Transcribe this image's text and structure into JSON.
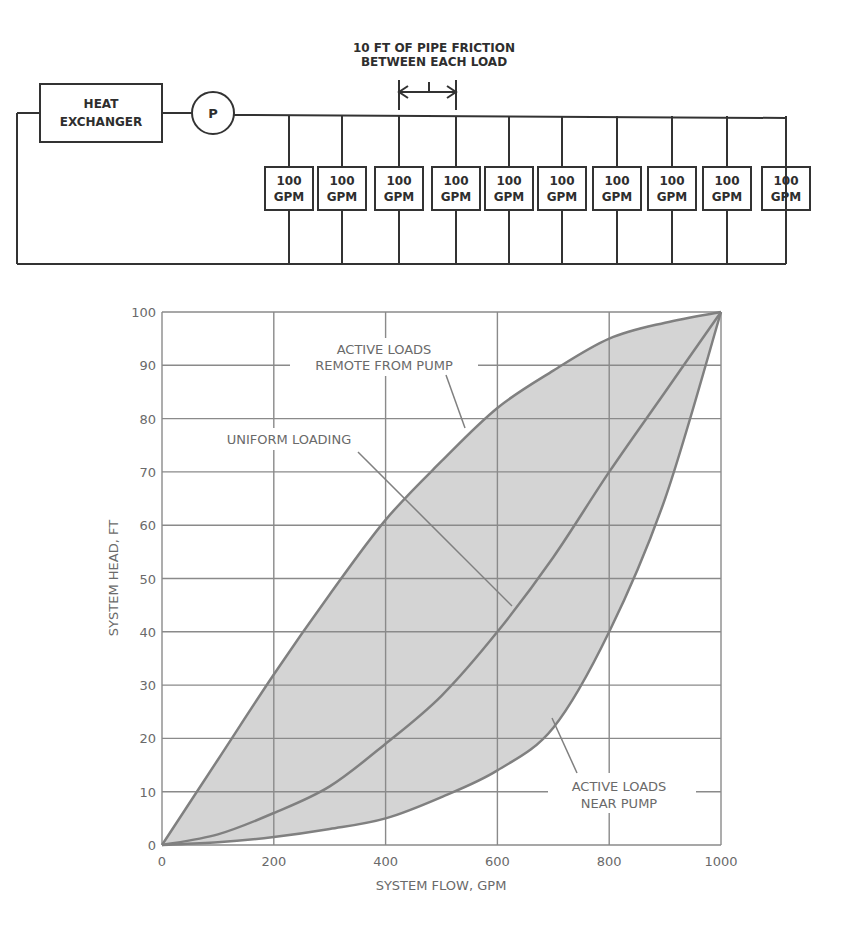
{
  "schematic": {
    "heat_exchanger_line1": "HEAT",
    "heat_exchanger_line2": "EXCHANGER",
    "pump_label": "P",
    "friction_note_line1": "10 FT OF PIPE FRICTION",
    "friction_note_line2": "BETWEEN EACH LOAD",
    "loads": [
      {
        "line1": "100",
        "line2": "GPM"
      },
      {
        "line1": "100",
        "line2": "GPM"
      },
      {
        "line1": "100",
        "line2": "GPM"
      },
      {
        "line1": "100",
        "line2": "GPM"
      },
      {
        "line1": "100",
        "line2": "GPM"
      },
      {
        "line1": "100",
        "line2": "GPM"
      },
      {
        "line1": "100",
        "line2": "GPM"
      },
      {
        "line1": "100",
        "line2": "GPM"
      },
      {
        "line1": "100",
        "line2": "GPM"
      },
      {
        "line1": "100",
        "line2": "GPM"
      }
    ]
  },
  "annotations": {
    "remote_line1": "ACTIVE LOADS",
    "remote_line2": "REMOTE FROM PUMP",
    "uniform": "UNIFORM LOADING",
    "near_line1": "ACTIVE LOADS",
    "near_line2": "NEAR PUMP"
  },
  "colors": {
    "line": "#808080",
    "fill": "#d4d4d4",
    "schematic_line": "#333333"
  },
  "chart_data": {
    "type": "line",
    "title": "",
    "xlabel": "SYSTEM FLOW, GPM",
    "ylabel": "SYSTEM HEAD, FT",
    "xlim": [
      0,
      1000
    ],
    "ylim": [
      0,
      100
    ],
    "x_ticks": [
      "0",
      "200",
      "400",
      "600",
      "800",
      "1000"
    ],
    "y_ticks": [
      "0",
      "10",
      "20",
      "30",
      "40",
      "50",
      "60",
      "70",
      "80",
      "90",
      "100"
    ],
    "grid": true,
    "legend": "none (inline annotations)",
    "shaded_region": "between 'Active loads remote from pump' and 'Active loads near pump'",
    "x": [
      0,
      100,
      200,
      300,
      400,
      500,
      600,
      700,
      800,
      900,
      1000
    ],
    "series": [
      {
        "name": "Active loads remote from pump",
        "values": [
          0,
          16,
          32,
          47,
          61,
          72,
          82,
          89,
          95,
          98,
          100
        ]
      },
      {
        "name": "Uniform loading",
        "values": [
          0,
          2,
          6,
          11,
          19,
          28,
          40,
          54,
          70,
          85,
          100
        ]
      },
      {
        "name": "Active loads near pump",
        "values": [
          0,
          0.5,
          1.5,
          3,
          5,
          9,
          14,
          22,
          40,
          65,
          100
        ]
      }
    ]
  }
}
